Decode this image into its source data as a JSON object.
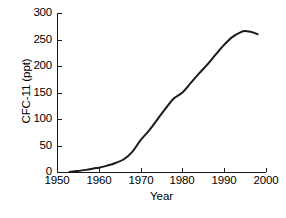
{
  "chart_data": {
    "type": "line",
    "title": "",
    "xlabel": "Year",
    "ylabel": "CFC-11 (ppt)",
    "xlim": [
      1950,
      2000
    ],
    "ylim": [
      0,
      300
    ],
    "xticks": [
      1950,
      1960,
      1970,
      1980,
      1990,
      2000
    ],
    "xtick_labels": [
      "1950",
      "1960",
      "1970",
      "1980",
      "1990",
      "2000"
    ],
    "yticks": [
      0,
      50,
      100,
      150,
      200,
      250,
      300
    ],
    "ytick_labels": [
      "0",
      "50",
      "100",
      "150",
      "200",
      "250",
      "300"
    ],
    "grid": false,
    "legend": null,
    "line_color": "#1a1a1a",
    "line_width": 2,
    "series": [
      {
        "name": "CFC-11",
        "x": [
          1953,
          1955,
          1957,
          1959,
          1960,
          1962,
          1964,
          1966,
          1968,
          1970,
          1972,
          1974,
          1976,
          1978,
          1980,
          1982,
          1984,
          1986,
          1988,
          1990,
          1992,
          1994,
          1995,
          1996,
          1997,
          1998
        ],
        "y": [
          0,
          2,
          4,
          7,
          8,
          12,
          17,
          24,
          38,
          60,
          78,
          99,
          120,
          139,
          150,
          168,
          186,
          203,
          222,
          240,
          255,
          264,
          266,
          265,
          263,
          260
        ]
      }
    ]
  },
  "axis": {
    "x_tick_positions_px": [
      57,
      99,
      141,
      183,
      224,
      266
    ],
    "y_tick_positions_px": [
      172,
      146,
      119,
      93,
      67,
      40,
      14
    ]
  }
}
